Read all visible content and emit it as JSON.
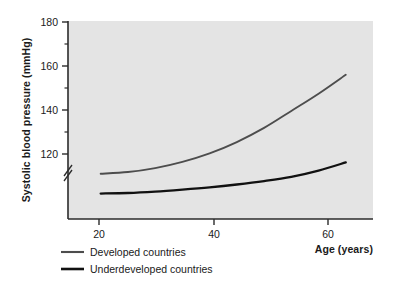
{
  "chart_data": {
    "type": "line",
    "title": "",
    "xlabel": "Age (years)",
    "ylabel": "Systolic blood pressure (mmHg)",
    "xlim": [
      14,
      70
    ],
    "ylim": [
      112,
      182
    ],
    "y_axis_break": true,
    "grid": false,
    "legend_position": "bottom-left",
    "x_ticks": [
      20,
      40,
      60
    ],
    "x_tick_labels": [
      "20",
      "40",
      "60"
    ],
    "y_ticks": [
      120,
      140,
      160,
      180
    ],
    "y_tick_labels": [
      "120",
      "140",
      "160",
      "180"
    ],
    "y_minor_ticks": [
      130,
      150,
      170
    ],
    "x": [
      20,
      25,
      30,
      35,
      40,
      45,
      50,
      55,
      60,
      65
    ],
    "series": [
      {
        "name": "Developed countries",
        "color": "#4d4d4d",
        "values": [
          128,
          128.6,
          130,
          132.2,
          135.2,
          139.2,
          144.2,
          150.2,
          156.3,
          163
        ]
      },
      {
        "name": "Underdeveloped countries",
        "color": "#111111",
        "values": [
          121,
          121.2,
          121.7,
          122.4,
          123.2,
          124.2,
          125.4,
          126.9,
          129.1,
          132
        ]
      }
    ]
  },
  "plot": {
    "background_color": "#e4e4e4",
    "axis_color": "#2b2b2b"
  },
  "legend": {
    "items": [
      {
        "label": "Developed countries",
        "color": "#4d4d4d"
      },
      {
        "label": "Underdeveloped countries",
        "color": "#111111"
      }
    ]
  }
}
